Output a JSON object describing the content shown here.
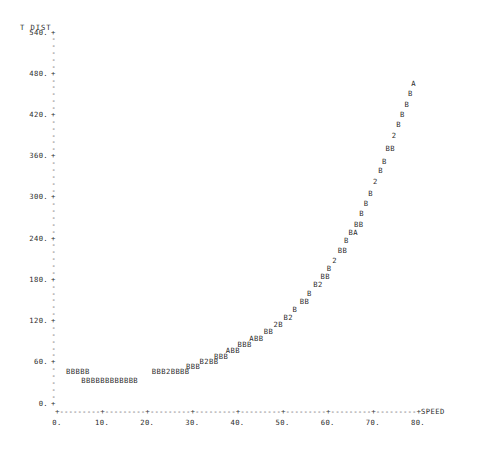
{
  "plot": {
    "kind": "character-scatter-plot",
    "ylabel": "T DIST",
    "xlabel": "SPEED",
    "x_axis_glyph": "+---------+---------+---------+---------+---------+---------+---------+---------+",
    "y_major_glyph": "+",
    "y_minor_glyph": "-",
    "yticks": [
      "540.",
      "480.",
      "420.",
      "360.",
      "300.",
      "240.",
      "180.",
      "120.",
      "60.",
      "0."
    ],
    "xticks": [
      "0.",
      "10.",
      "20.",
      "30.",
      "40.",
      "50.",
      "60.",
      "70.",
      "80."
    ],
    "ylim": [
      0,
      540
    ],
    "xlim": [
      0,
      80
    ],
    "ink_color": "#2b2b2b",
    "background_color": "#ffffff"
  },
  "chart_data": {
    "type": "scatter",
    "title": "",
    "xlabel": "SPEED",
    "ylabel": "T DIST",
    "xlim": [
      0,
      80
    ],
    "ylim": [
      0,
      540
    ],
    "grid": false,
    "legend": null,
    "marker_rows": [
      {
        "text": "A",
        "x": 78.5,
        "y": 465
      },
      {
        "text": "B",
        "x": 77.8,
        "y": 450
      },
      {
        "text": "B",
        "x": 77.0,
        "y": 435
      },
      {
        "text": "B",
        "x": 76.0,
        "y": 420
      },
      {
        "text": "B",
        "x": 75.2,
        "y": 405
      },
      {
        "text": "2",
        "x": 74.2,
        "y": 390
      },
      {
        "text": "BB",
        "x": 72.8,
        "y": 370
      },
      {
        "text": "B",
        "x": 72.0,
        "y": 352
      },
      {
        "text": "B",
        "x": 71.2,
        "y": 338
      },
      {
        "text": "2",
        "x": 70.0,
        "y": 322
      },
      {
        "text": "B",
        "x": 69.0,
        "y": 305
      },
      {
        "text": "B",
        "x": 68.0,
        "y": 290
      },
      {
        "text": "B",
        "x": 67.0,
        "y": 276
      },
      {
        "text": "BB",
        "x": 65.8,
        "y": 260
      },
      {
        "text": "BA",
        "x": 64.6,
        "y": 248
      },
      {
        "text": "B",
        "x": 63.6,
        "y": 236
      },
      {
        "text": "BB",
        "x": 62.2,
        "y": 222
      },
      {
        "text": "2",
        "x": 61.0,
        "y": 208
      },
      {
        "text": "B",
        "x": 59.8,
        "y": 196
      },
      {
        "text": "BB",
        "x": 58.4,
        "y": 184
      },
      {
        "text": "B2",
        "x": 56.8,
        "y": 172
      },
      {
        "text": "B",
        "x": 55.4,
        "y": 160
      },
      {
        "text": "BB",
        "x": 53.8,
        "y": 148
      },
      {
        "text": "B",
        "x": 52.2,
        "y": 136
      },
      {
        "text": "B2",
        "x": 50.2,
        "y": 124
      },
      {
        "text": "2B",
        "x": 48.0,
        "y": 114
      },
      {
        "text": "BB",
        "x": 45.8,
        "y": 104
      },
      {
        "text": "ABB",
        "x": 42.6,
        "y": 94
      },
      {
        "text": "BBB",
        "x": 40.0,
        "y": 85
      },
      {
        "text": "ABB",
        "x": 37.4,
        "y": 76
      },
      {
        "text": "BBB",
        "x": 34.8,
        "y": 68
      },
      {
        "text": "B2BB",
        "x": 31.6,
        "y": 60
      },
      {
        "text": "BBB",
        "x": 28.6,
        "y": 53
      },
      {
        "text": "BBB2BBBB",
        "x": 21.0,
        "y": 46
      },
      {
        "text": "BBBBB",
        "x": 2.0,
        "y": 46
      },
      {
        "text": "BBBBBBBBBBBB",
        "x": 5.4,
        "y": 33
      }
    ]
  }
}
